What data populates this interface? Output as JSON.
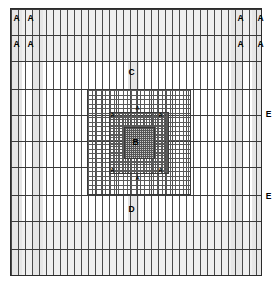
{
  "diagram": {
    "colors": {
      "border": "#2b2b2b",
      "major_line": "#4a4a4a",
      "minor_line": "#8d8d8d",
      "shade": "#e8e8e8",
      "shade_soft": "#efefef",
      "refine_fill": "#cfcfcf",
      "text": "#000000",
      "background": "#ffffff"
    },
    "labels": {
      "corner_a": "A",
      "inner_a": "A",
      "top_c": "C",
      "bottom_d": "D",
      "edge_e": "E",
      "core_b": "B"
    },
    "corner_labels": [
      {
        "text": "A",
        "x": 16,
        "y": 18
      },
      {
        "text": "A",
        "x": 36,
        "y": 18
      },
      {
        "text": "A",
        "x": 232,
        "y": 18
      },
      {
        "text": "A",
        "x": 253,
        "y": 18
      },
      {
        "text": "A",
        "x": 16,
        "y": 44
      },
      {
        "text": "A",
        "x": 36,
        "y": 44
      },
      {
        "text": "A",
        "x": 232,
        "y": 44
      },
      {
        "text": "A",
        "x": 253,
        "y": 44
      }
    ],
    "inner_labels": [
      {
        "text": "A",
        "x": 137,
        "y": 109
      },
      {
        "text": "A",
        "x": 112,
        "y": 116
      },
      {
        "text": "A",
        "x": 160,
        "y": 116
      },
      {
        "text": "A",
        "x": 112,
        "y": 171
      },
      {
        "text": "A",
        "x": 160,
        "y": 171
      },
      {
        "text": "A",
        "x": 137,
        "y": 179
      }
    ],
    "region_labels": [
      {
        "text": "C",
        "x": 131,
        "y": 72
      },
      {
        "text": "D",
        "x": 131,
        "y": 209
      },
      {
        "text": "B",
        "x": 135,
        "y": 142
      }
    ],
    "edge_labels": [
      {
        "text": "E",
        "x": 266,
        "y": 114
      },
      {
        "text": "E",
        "x": 266,
        "y": 196
      }
    ],
    "base_grid": {
      "v_count": 36,
      "h_count": 12,
      "note": "uniform background grid"
    },
    "refinement_levels": [
      {
        "level": 1,
        "label": "outer refined block",
        "divisions": 24
      },
      {
        "level": 2,
        "label": "middle refined block",
        "divisions": 22
      },
      {
        "level": 3,
        "label": "core block",
        "divisions": 20
      }
    ]
  }
}
